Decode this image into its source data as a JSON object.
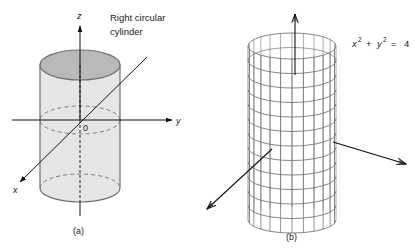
{
  "figure_a": {
    "caption": "(a)",
    "title_line1": "Right circular",
    "title_line2": "cylinder",
    "axis_z_label": "z",
    "axis_y_label": "y",
    "axis_x_label": "x",
    "origin_label": "0",
    "colors": {
      "top_face": "#b9b9b9",
      "body": "#e6e6e6",
      "stroke": "#6f6f6f",
      "axis": "#111111"
    }
  },
  "figure_b": {
    "caption": "(b)",
    "equation_x": "x",
    "equation_x_exp": "2",
    "equation_plus": "+",
    "equation_y": "y",
    "equation_y_exp": "2",
    "equation_eq": "=",
    "equation_rhs": "4",
    "grid": {
      "vertical_lines": 24,
      "horizontal_rings": 13
    },
    "colors": {
      "mesh": "#777777",
      "axis": "#111111"
    }
  }
}
